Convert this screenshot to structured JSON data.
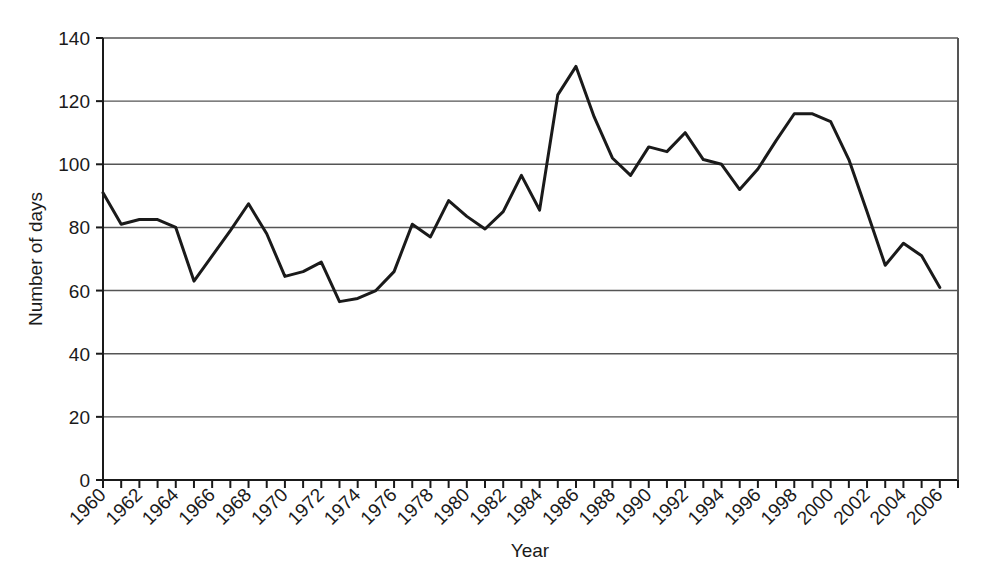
{
  "chart_data": {
    "type": "line",
    "title": "",
    "xlabel": "Year",
    "ylabel": "Number of days",
    "xlim": [
      1960,
      2007
    ],
    "ylim": [
      0,
      140
    ],
    "ytick_labels": [
      "140",
      "120",
      "100",
      "80",
      "60",
      "40",
      "20",
      "0"
    ],
    "ytick_values": [
      140,
      120,
      100,
      80,
      60,
      40,
      20,
      0
    ],
    "xtick_labels": [
      "1960",
      "1962",
      "1964",
      "1966",
      "1968",
      "1970",
      "1972",
      "1974",
      "1976",
      "1978",
      "1980",
      "1982",
      "1984",
      "1986",
      "1988",
      "1990",
      "1992",
      "1994",
      "1996",
      "1998",
      "2000",
      "2002",
      "2004",
      "2006"
    ],
    "xtick_values": [
      1960,
      1962,
      1964,
      1966,
      1968,
      1970,
      1972,
      1974,
      1976,
      1978,
      1980,
      1982,
      1984,
      1986,
      1988,
      1990,
      1992,
      1994,
      1996,
      1998,
      2000,
      2002,
      2004,
      2006
    ],
    "minor_xticks_every": 1,
    "grid": "horizontal",
    "legend": "none",
    "line_color": "#1a1a1a",
    "line_width": 3,
    "x": [
      1960,
      1961,
      1962,
      1963,
      1964,
      1965,
      1966,
      1967,
      1968,
      1969,
      1970,
      1971,
      1972,
      1973,
      1974,
      1975,
      1976,
      1977,
      1978,
      1979,
      1980,
      1981,
      1982,
      1983,
      1984,
      1985,
      1986,
      1987,
      1988,
      1989,
      1990,
      1991,
      1992,
      1993,
      1994,
      1995,
      1996,
      1997,
      1998,
      1999,
      2000,
      2001,
      2002,
      2003,
      2004,
      2005,
      2006
    ],
    "values": [
      91,
      81,
      82.5,
      82.5,
      80,
      63,
      71,
      79,
      87.5,
      78,
      64.5,
      66,
      69,
      56.5,
      57.5,
      60,
      66,
      81,
      77,
      88.5,
      83.5,
      79.5,
      85,
      96.5,
      85.5,
      122,
      131,
      115,
      102,
      96.5,
      105.5,
      104,
      110,
      101.5,
      100,
      92,
      98.5,
      107.5,
      116,
      116,
      113.5,
      101.5,
      85,
      68,
      75,
      71,
      61
    ]
  },
  "axis": {
    "y_title": "Number of days",
    "x_title": "Year"
  }
}
